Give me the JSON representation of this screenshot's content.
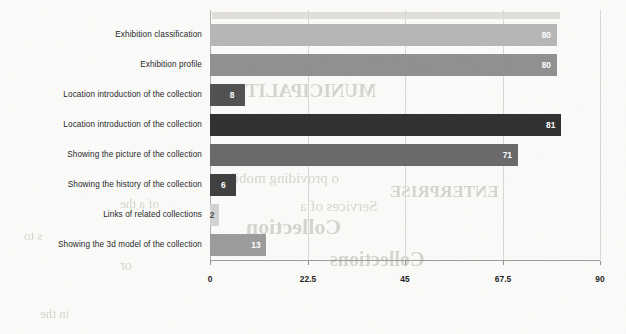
{
  "chart_data": {
    "type": "bar",
    "orientation": "horizontal",
    "title": "",
    "xlabel": "",
    "ylabel": "",
    "xlim": [
      0,
      90
    ],
    "grid": true,
    "legend": false,
    "xticks": [
      "0",
      "22.5",
      "45",
      "67.5",
      "90"
    ],
    "xtick_values": [
      0,
      22.5,
      45,
      67.5,
      90
    ],
    "categories": [
      "Exhibition classification",
      "Exhibition profile",
      "Location introduction of the collection",
      "Location introduction of the collection",
      "Showing the picture of the collection",
      "Showing the history of the collection",
      "Links of related collections",
      "Showing the 3d model of the collection"
    ],
    "values": [
      80,
      80,
      8,
      81,
      71,
      6,
      2,
      13
    ],
    "value_labels": [
      "80",
      "80",
      "8",
      "81",
      "71",
      "6",
      "2",
      "13"
    ],
    "bar_colors": [
      "#b6b6b6",
      "#8f8f8f",
      "#4f4f4f",
      "#2e2e2e",
      "#686868",
      "#3d3d3d",
      "#d3d3d3",
      "#9b9b9b"
    ]
  },
  "ghost_text": {
    "lines": [
      "MUNICIPALITY",
      "o providing mobile",
      "Services of a",
      "Collection",
      "ENTERPRISE",
      "of a the",
      "s to",
      "Collections",
      "or",
      "in the"
    ]
  }
}
